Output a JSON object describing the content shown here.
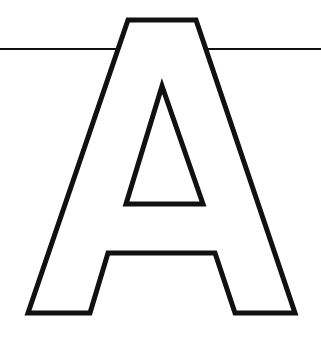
{
  "figure": {
    "letter": "A",
    "background": "#ffffff",
    "stroke_color": "#111111",
    "outline_width": 5,
    "line_width": 2,
    "baseline_y": 49
  }
}
